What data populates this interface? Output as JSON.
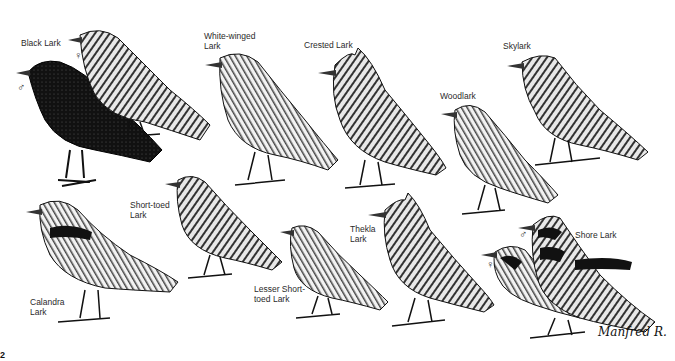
{
  "plate": {
    "title": "Larks",
    "labels": {
      "black_lark": "Black Lark",
      "white_winged_lark": "White-winged\nLark",
      "crested_lark": "Crested Lark",
      "skylark": "Skylark",
      "woodlark": "Woodlark",
      "short_toed_lark": "Short-toed\nLark",
      "thekla_lark": "Thekla\nLark",
      "lesser_short_toed_lark": "Lesser Short-\ntoed Lark",
      "calandra_lark": "Calandra\nLark",
      "shore_lark": "Shore Lark"
    },
    "sex_symbols": {
      "black_lark_male": "♂",
      "black_lark_female": "♀",
      "shore_lark_male": "♂",
      "shore_lark_female": "♀"
    },
    "signature": "Manfred R.",
    "corner_mark": "2"
  },
  "colors": {
    "ink": "#111111",
    "paper": "#ffffff",
    "plumage_dark": "#1a1a1a",
    "plumage_mid": "#6a6a6a",
    "plumage_light": "#d8d8d8"
  }
}
